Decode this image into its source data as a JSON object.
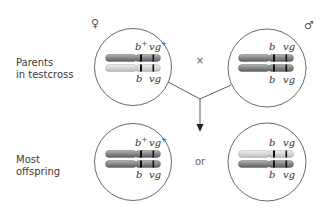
{
  "diagram": {
    "rows": [
      {
        "label_lines": [
          "Parents",
          "in testcross"
        ]
      },
      {
        "label_lines": [
          "Most",
          "offspring"
        ]
      }
    ],
    "symbols": {
      "female": "♀",
      "male": "♂",
      "cross": "×",
      "or": "or"
    },
    "genes": {
      "b_plus": "b",
      "vg_plus": "vg",
      "plus_sup": "+",
      "b": "b",
      "vg": "vg"
    },
    "cells": [
      {
        "id": "female-parent",
        "top": {
          "b": "b+",
          "vg": "vg+",
          "color": "dark"
        },
        "bottom": {
          "b": "b",
          "vg": "vg",
          "color": "light"
        }
      },
      {
        "id": "male-parent",
        "top": {
          "b": "b",
          "vg": "vg",
          "color": "dark"
        },
        "bottom": {
          "b": "b",
          "vg": "vg",
          "color": "dark"
        }
      },
      {
        "id": "offspring-wildtype",
        "top": {
          "b": "b+",
          "vg": "vg+",
          "color": "dark"
        },
        "bottom": {
          "b": "b",
          "vg": "vg",
          "color": "dark"
        }
      },
      {
        "id": "offspring-mutant",
        "top": {
          "b": "b",
          "vg": "vg",
          "color": "light"
        },
        "bottom": {
          "b": "b",
          "vg": "vg",
          "color": "dark"
        }
      }
    ],
    "colors": {
      "chromosome_dark": "#8a8a8a",
      "chromosome_light": "#d4d4d4",
      "band": "#111111",
      "outline": "#444444"
    }
  }
}
